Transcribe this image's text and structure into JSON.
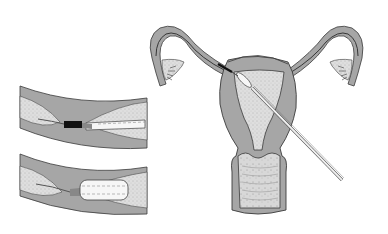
{
  "figure": {
    "type": "medical-illustration",
    "text_labels": [],
    "colors": {
      "background": "#ffffff",
      "tissue_wall": "#a6a6a6",
      "lumen_stippled": "#dcdcdc",
      "outline": "#3a3a3a",
      "balloon": "#f6f6f6",
      "occlusion": "#111111"
    },
    "panels": [
      {
        "id": "inset-top",
        "description": "Fallopian tube segment with occlusion and deflated balloon catheter"
      },
      {
        "id": "inset-bottom",
        "description": "Fallopian tube segment with inflated balloon catheter"
      },
      {
        "id": "main",
        "description": "Frontal section of uterus, tubes, ovaries' fimbriae, cervix and vagina with catheter inserted"
      }
    ]
  }
}
